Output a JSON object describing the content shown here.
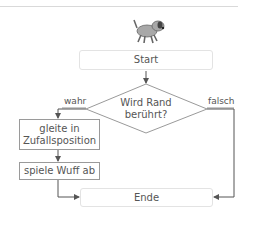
{
  "diagram": {
    "sprite_icon": "dog-sprite-icon",
    "start": "Start",
    "decision": {
      "line1": "Wird Rand",
      "line2": "berührt?"
    },
    "yes_label": "wahr",
    "no_label": "falsch",
    "step1": {
      "line1": "gleite in",
      "line2": "Zufallsposition"
    },
    "step2": "spiele Wuff ab",
    "end": "Ende"
  },
  "colors": {
    "line": "#707070",
    "box_border": "#9a9a9a",
    "terminal_border": "#e3e3e3",
    "dog": "#a0a0a0"
  }
}
